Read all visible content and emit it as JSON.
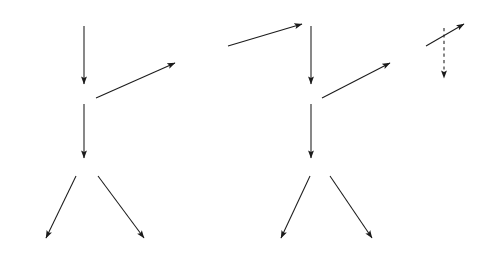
{
  "figure": {
    "type": "reaction-pathway-diagram",
    "background_color": "#ffffff",
    "ink_color": "#1b1b1b"
  },
  "nodes": [
    {
      "id": "caugcu_oh",
      "text": "CAUGCU",
      "prefix": "——",
      "suffix": "OH",
      "suffix_style": "oh",
      "x": 22,
      "y": 10
    },
    {
      "id": "caugcu_ox",
      "text": "CAUGCU",
      "prefix": "——",
      "suffix": "ox",
      "suffix_style": "sub",
      "x": 18,
      "y": 88
    },
    {
      "id": "caugcu_inh",
      "text": "CAUGCU·INH",
      "prefix": "——",
      "suffix": "",
      "suffix_style": "none",
      "x": 18,
      "y": 162
    },
    {
      "id": "cu_inh",
      "text": "CU·INH",
      "prefix": "",
      "suffix": "",
      "suffix_style": "none",
      "x": 20,
      "y": 245
    },
    {
      "id": "u_inh",
      "text": "U·INH",
      "prefix": "",
      "suffix": "",
      "suffix_style": "none",
      "x": 131,
      "y": 245
    },
    {
      "id": "caugc_p",
      "text": "CAUGC",
      "prefix": "——",
      "suffix": "p",
      "suffix_style": "subp",
      "x": 155,
      "y": 50
    },
    {
      "id": "caugc_oh",
      "text": "CAUGC",
      "prefix": "——",
      "suffix": "OH",
      "suffix_style": "oh",
      "x": 268,
      "y": 10
    },
    {
      "id": "caugc_ox",
      "text": "CAUGC",
      "prefix": "——",
      "suffix": "ox",
      "suffix_style": "sub",
      "x": 265,
      "y": 88
    },
    {
      "id": "caugc_inh",
      "text": "CAUGC·INH",
      "prefix": "——",
      "suffix": "",
      "suffix_style": "none",
      "x": 264,
      "y": 162
    },
    {
      "id": "c_inh",
      "text": "C·INH",
      "prefix": "",
      "suffix": "",
      "suffix_style": "none",
      "x": 256,
      "y": 245
    },
    {
      "id": "gc_inh",
      "text": "GC·INH",
      "prefix": "",
      "suffix": "",
      "suffix_style": "none",
      "x": 348,
      "y": 245
    },
    {
      "id": "caug_p",
      "text": "CAUGp",
      "prefix": "——",
      "suffix": "",
      "suffix_style": "none",
      "x": 372,
      "y": 50
    },
    {
      "id": "caug_oh",
      "text": "CAUG",
      "prefix": "——",
      "suffix": "OH",
      "suffix_style": "oh",
      "x": 412,
      "y": 10
    }
  ],
  "reagents": [
    {
      "id": "periodate_1",
      "base": "IO",
      "sub": "4",
      "sup": "–",
      "x": 90,
      "y": 44
    },
    {
      "id": "periodate_2",
      "base": "IO",
      "sub": "4",
      "sup": "–",
      "x": 313,
      "y": 44
    },
    {
      "id": "periodate_3",
      "base": "IO",
      "sub": "4",
      "sup": "–",
      "x": 444,
      "y": 40
    },
    {
      "id": "inh_label_1",
      "text_open": "(",
      "sup": "3",
      "text_rest": "H)·INH",
      "x": 88,
      "y": 124
    },
    {
      "id": "inh_label_2",
      "text_open": "(",
      "sup": "3",
      "text_rest": "H)·INH",
      "x": 323,
      "y": 124
    }
  ],
  "labels": [
    {
      "id": "aniline_1",
      "text": "ANILINE",
      "x": 125,
      "y": 77,
      "style": "caps"
    },
    {
      "id": "aniline_2",
      "text": "ANILINE",
      "x": 344,
      "y": 77,
      "style": "caps"
    },
    {
      "id": "alk_phos_1_a",
      "text": "ALKALINE",
      "x": 222,
      "y": 22,
      "style": "caps"
    },
    {
      "id": "alk_phos_1_b",
      "text": "PHOSPHATASE",
      "x": 178,
      "y": 33,
      "style": "caps"
    },
    {
      "id": "alk_phos_2_a",
      "text": "ALKALINE",
      "x": 394,
      "y": 22,
      "style": "caps"
    },
    {
      "id": "alk_phos_2_b",
      "text": "PHOSPHATASE",
      "x": 366,
      "y": 33,
      "style": "caps"
    },
    {
      "id": "t1_1",
      "text": "T",
      "sub": "1",
      "x": 31,
      "y": 193,
      "style": "caps"
    },
    {
      "id": "rnaase_1",
      "text": "RNAase",
      "x": 11,
      "y": 209,
      "style": "mixed"
    },
    {
      "id": "panc_1",
      "text": "Pancreatic",
      "x": 131,
      "y": 192,
      "style": "mixed"
    },
    {
      "id": "rnaase_2",
      "text": "RNAase",
      "x": 141,
      "y": 209,
      "style": "mixed"
    },
    {
      "id": "t1_2",
      "text": "T",
      "sub": "1",
      "x": 266,
      "y": 193,
      "style": "caps"
    },
    {
      "id": "rnaase_3",
      "text": "RNAase",
      "x": 246,
      "y": 209,
      "style": "mixed"
    },
    {
      "id": "panc_2",
      "text": "Pancreatic",
      "x": 353,
      "y": 192,
      "style": "mixed"
    },
    {
      "id": "rnaase_4",
      "text": "RNAase",
      "x": 358,
      "y": 209,
      "style": "mixed"
    }
  ],
  "arrows": [
    {
      "id": "arrow-caugcu-oh-to-ox",
      "x1": 84,
      "y1": 26,
      "x2": 84,
      "y2": 84,
      "dashed": false
    },
    {
      "id": "arrow-caugcu-ox-to-inh",
      "x1": 84,
      "y1": 104,
      "x2": 84,
      "y2": 158,
      "dashed": false
    },
    {
      "id": "arrow-caugcu-ox-to-caugcp",
      "x1": 96,
      "y1": 98,
      "x2": 175,
      "y2": 63,
      "dashed": false
    },
    {
      "id": "arrow-caugcp-to-caugc-oh",
      "x1": 228,
      "y1": 46,
      "x2": 302,
      "y2": 24,
      "dashed": false
    },
    {
      "id": "arrow-caugc-oh-to-ox",
      "x1": 311,
      "y1": 26,
      "x2": 311,
      "y2": 84,
      "dashed": false
    },
    {
      "id": "arrow-caugc-ox-to-inh",
      "x1": 311,
      "y1": 104,
      "x2": 311,
      "y2": 158,
      "dashed": false
    },
    {
      "id": "arrow-caugc-ox-to-caugp",
      "x1": 322,
      "y1": 98,
      "x2": 390,
      "y2": 63,
      "dashed": false
    },
    {
      "id": "arrow-caugp-to-caug-oh",
      "x1": 426,
      "y1": 46,
      "x2": 464,
      "y2": 24,
      "dashed": false
    },
    {
      "id": "arrow-caug-oh-dashed",
      "x1": 444,
      "y1": 28,
      "x2": 444,
      "y2": 78,
      "dashed": true
    },
    {
      "id": "arrow-caugcu-inh-to-cu",
      "x1": 76,
      "y1": 176,
      "x2": 46,
      "y2": 238,
      "dashed": false
    },
    {
      "id": "arrow-caugcu-inh-to-u",
      "x1": 98,
      "y1": 176,
      "x2": 144,
      "y2": 238,
      "dashed": false
    },
    {
      "id": "arrow-caugc-inh-to-c",
      "x1": 310,
      "y1": 176,
      "x2": 281,
      "y2": 238,
      "dashed": false
    },
    {
      "id": "arrow-caugc-inh-to-gc",
      "x1": 330,
      "y1": 176,
      "x2": 372,
      "y2": 238,
      "dashed": false
    }
  ]
}
